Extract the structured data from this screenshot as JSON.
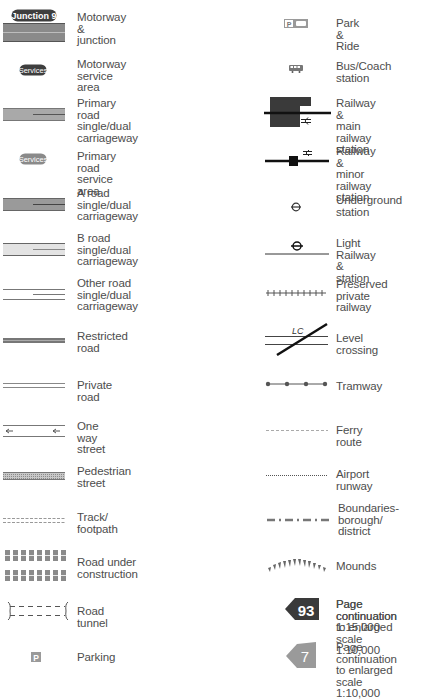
{
  "legend": {
    "left": [
      {
        "id": "motorway",
        "label": "Motorway &\njunction",
        "badge": "Junction 9"
      },
      {
        "id": "motorway-services",
        "label": "Motorway\nservice area",
        "badge": "Services"
      },
      {
        "id": "primary-road",
        "label": "Primary road\nsingle/dual\ncarriageway"
      },
      {
        "id": "primary-services",
        "label": "Primary road\nservice area",
        "badge": "Services"
      },
      {
        "id": "a-road",
        "label": "A road\nsingle/dual\ncarriageway"
      },
      {
        "id": "b-road",
        "label": "B road\nsingle/dual\ncarriageway"
      },
      {
        "id": "other-road",
        "label": "Other road\nsingle/dual\ncarriageway"
      },
      {
        "id": "restricted-road",
        "label": "Restricted\nroad"
      },
      {
        "id": "private-road",
        "label": "Private road"
      },
      {
        "id": "one-way",
        "label": "One way\nstreet"
      },
      {
        "id": "pedestrian",
        "label": "Pedestrian\nstreet"
      },
      {
        "id": "track",
        "label": "Track/\nfootpath"
      },
      {
        "id": "construction",
        "label": "Road under\nconstruction"
      },
      {
        "id": "tunnel",
        "label": "Road tunnel"
      },
      {
        "id": "parking",
        "label": "Parking",
        "badge": "P"
      }
    ],
    "right": [
      {
        "id": "park-ride",
        "label": "Park & Ride",
        "badge": "P+"
      },
      {
        "id": "bus-station",
        "label": "Bus/Coach\nstation"
      },
      {
        "id": "main-railway",
        "label": "Railway &\nmain railway\nstation"
      },
      {
        "id": "minor-railway",
        "label": "Railway &\nminor railway\nstation"
      },
      {
        "id": "underground",
        "label": "Underground\nstation"
      },
      {
        "id": "light-railway",
        "label": "Light Railway &\nstation"
      },
      {
        "id": "preserved-railway",
        "label": "Preserved\nprivate\nrailway"
      },
      {
        "id": "level-crossing",
        "label": "Level\ncrossing",
        "badge": "LC"
      },
      {
        "id": "tramway",
        "label": "Tramway"
      },
      {
        "id": "ferry",
        "label": "Ferry route"
      },
      {
        "id": "airport-runway",
        "label": "Airport runway"
      },
      {
        "id": "boundaries",
        "label": "Boundaries-\nborough/\ndistrict"
      },
      {
        "id": "mounds",
        "label": "Mounds"
      },
      {
        "id": "page-continuation",
        "label": "Page continuation\n1:15,000",
        "badge": "93"
      },
      {
        "id": "page-continuation-enlarged",
        "label": "Page continuation\nto enlarged scale\n1:10,000",
        "badge": "7"
      }
    ]
  },
  "colors": {
    "motorway": "#8a8a8a",
    "primary": "#a9a9a9",
    "a_road": "#9a9a9a",
    "b_road": "#e3e3e3",
    "dark": "#3e3e3e",
    "station": "#3a3a3a",
    "text": "#4d4d4d"
  }
}
